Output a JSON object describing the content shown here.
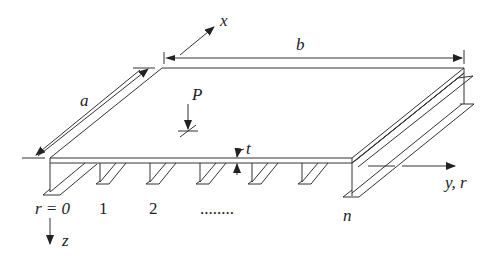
{
  "diagram": {
    "labels": {
      "x_axis": "x",
      "y_axis": "y, r",
      "z_axis": "z",
      "length_a": "a",
      "width_b": "b",
      "load": "P",
      "thickness": "t"
    },
    "stiffener_indices": {
      "r0": "r = 0",
      "r1": "1",
      "r2": "2",
      "ellipsis": "........",
      "rn": "n"
    },
    "colors": {
      "line": "#333333",
      "background": "#ffffff"
    }
  }
}
